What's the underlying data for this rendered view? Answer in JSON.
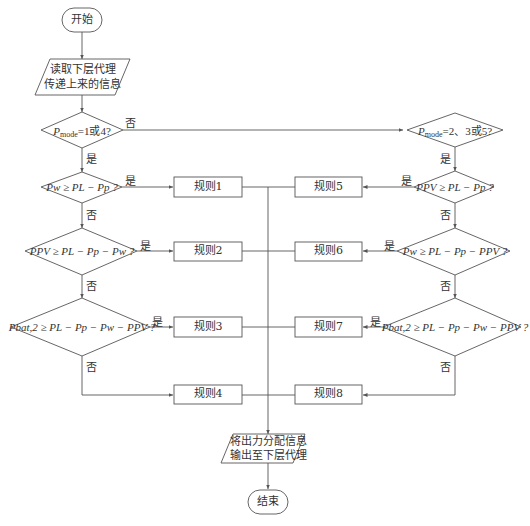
{
  "flowchart": {
    "start": "开始",
    "end": "结束",
    "read_input": [
      "读取下层代理",
      "传递上来的信息"
    ],
    "output": [
      "将出力分配信息",
      "输出至下层代理"
    ],
    "left_branch": {
      "mode_check": {
        "var": "P",
        "sub": "mode",
        "text": "=1或4?"
      },
      "conditions": [
        {
          "id": "L1",
          "text": "Pw ≥ PL − Pp ?",
          "rule": "规则1"
        },
        {
          "id": "L2",
          "text": "PPV ≥ PL − Pp − Pw ?",
          "rule": "规则2"
        },
        {
          "id": "L3",
          "text": "Pbat,2 ≥ PL − Pp − Pw − PPV ?",
          "rule": "规则3"
        }
      ],
      "fallback_rule": "规则4"
    },
    "right_branch": {
      "mode_check": {
        "var": "P",
        "sub": "mode",
        "text": "=2、3或5?"
      },
      "conditions": [
        {
          "id": "R1",
          "text": "PPV ≥ PL − Pp ?",
          "rule": "规则5"
        },
        {
          "id": "R2",
          "text": "Pw ≥ PL − Pp − PPV ?",
          "rule": "规则6"
        },
        {
          "id": "R3",
          "text": "Pbat,2 ≥ PL − Pp − Pw − PPV ?",
          "rule": "规则7"
        }
      ],
      "fallback_rule": "规则8"
    },
    "labels": {
      "yes": "是",
      "no": "否"
    },
    "rules": [
      "规则1",
      "规则2",
      "规则3",
      "规则4",
      "规则5",
      "规则6",
      "规则7",
      "规则8"
    ]
  },
  "colors": {
    "line": "#555555",
    "text": "#333333",
    "background": "#ffffff"
  }
}
